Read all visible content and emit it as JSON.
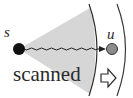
{
  "diagram": {
    "nodes": [
      {
        "id": "s",
        "label": "s",
        "fill": "#111111"
      },
      {
        "id": "u",
        "label": "u",
        "fill": "#8c8c8c"
      }
    ],
    "edge": {
      "from": "s",
      "to": "u",
      "style": "wavy",
      "arrow": true
    },
    "region": {
      "label": "scanned",
      "fill": "#d4d4d4"
    },
    "frontier_arrow": {
      "direction": "right"
    },
    "colors": {
      "stroke": "#2a2a2a",
      "wedge": "#d4d4d4",
      "node_s": "#111111",
      "node_u": "#8c8c8c"
    }
  }
}
